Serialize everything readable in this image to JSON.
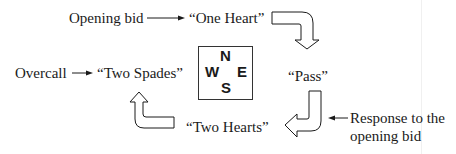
{
  "diagram": {
    "type": "bidding-cycle",
    "compass": {
      "north": "N",
      "south": "S",
      "east": "E",
      "west": "W"
    },
    "bids": {
      "north": "“One Heart”",
      "east": "“Pass”",
      "south": "“Two Hearts”",
      "west": "“Two Spades”"
    },
    "labels": {
      "opening_bid": "Opening bid",
      "overcall": "Overcall",
      "response_line1": "Response to the",
      "response_line2": "opening bid"
    },
    "flow": [
      "north",
      "east",
      "south",
      "west"
    ],
    "colors": {
      "ink": "#1a1a1a",
      "background": "#ffffff"
    }
  }
}
